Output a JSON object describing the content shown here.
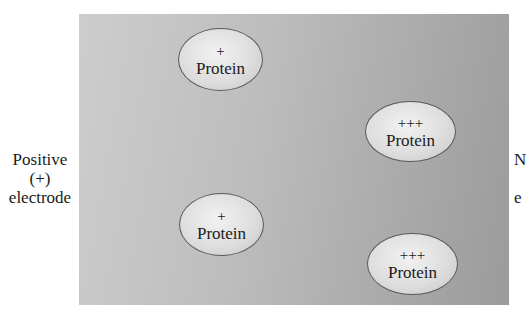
{
  "diagram": {
    "left_electrode": {
      "line1": "Positive",
      "line2": "(+)",
      "line3": "electrode"
    },
    "right_electrode": {
      "line1": "N",
      "line2": "",
      "line3": "e"
    },
    "proteins": [
      {
        "charge": "+",
        "label": "Protein"
      },
      {
        "charge": "+++",
        "label": "Protein"
      },
      {
        "charge": "+",
        "label": "Protein"
      },
      {
        "charge": "+++",
        "label": "Protein"
      }
    ],
    "colors": {
      "gel_light": "#cdcdcd",
      "gel_dark": "#9b9b9b",
      "protein_fill": "#e6e6e6",
      "outline": "#5a5a5a"
    }
  }
}
